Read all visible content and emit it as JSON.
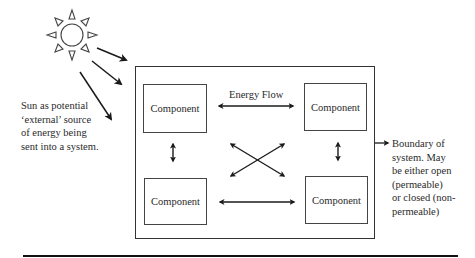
{
  "diagram": {
    "sun_caption": [
      "Sun as potential",
      "‘external’ source",
      "of energy being",
      "sent into a system."
    ],
    "energy_flow_label": "Energy Flow",
    "components": [
      {
        "label": "Component",
        "position": "top-left"
      },
      {
        "label": "Component",
        "position": "top-right"
      },
      {
        "label": "Component",
        "position": "bottom-left"
      },
      {
        "label": "Component",
        "position": "bottom-right"
      }
    ],
    "boundary_caption": [
      "Boundary of",
      "system. May",
      "be either open",
      "(permeable)",
      "or closed (non-",
      "permeable)"
    ],
    "icons": {
      "sun": "sun-icon",
      "arrows": "double-headed-arrow"
    },
    "colors": {
      "line": "#222222",
      "box_border": "#444444",
      "text": "#2a2a2a",
      "background": "#ffffff"
    }
  }
}
